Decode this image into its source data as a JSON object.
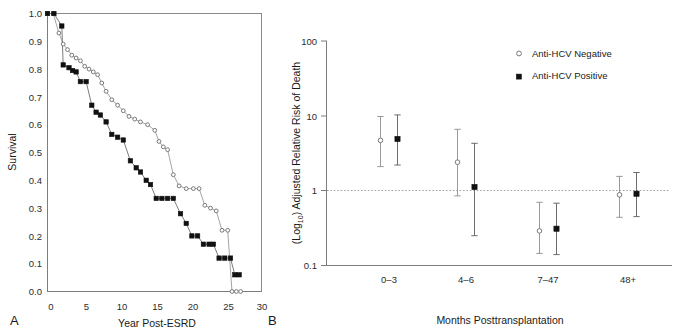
{
  "figure": {
    "panel_a_letter": "A",
    "panel_b_letter": "B"
  },
  "chart_data": [
    {
      "type": "line",
      "panel": "A",
      "title": "",
      "xlabel": "Year Post-ESRD",
      "ylabel": "Survival",
      "xlim": [
        0,
        30
      ],
      "ylim": [
        0.0,
        1.0
      ],
      "xticks": [
        "0",
        "5",
        "10",
        "15",
        "20",
        "25",
        "30"
      ],
      "yticks": [
        "0.0",
        "0.1",
        "0.2",
        "0.3",
        "0.4",
        "0.5",
        "0.6",
        "0.7",
        "0.8",
        "0.9",
        "1.0"
      ],
      "grid": false,
      "legend_position": "none",
      "series": [
        {
          "name": "Anti-HCV Negative",
          "marker": "open-circle",
          "x": [
            0.0,
            0.8,
            1.6,
            2.2,
            2.8,
            3.4,
            4.0,
            4.6,
            5.2,
            5.8,
            6.4,
            7.0,
            7.6,
            8.2,
            9.0,
            9.8,
            10.6,
            11.4,
            12.2,
            13.0,
            14.0,
            15.0,
            15.6,
            16.2,
            16.8,
            17.6,
            18.4,
            19.4,
            20.4,
            21.2,
            22.0,
            22.8,
            23.6,
            24.4,
            25.2,
            25.8,
            26.4,
            27.0
          ],
          "y": [
            1.0,
            1.0,
            0.93,
            0.89,
            0.87,
            0.85,
            0.84,
            0.83,
            0.81,
            0.8,
            0.79,
            0.78,
            0.75,
            0.72,
            0.69,
            0.67,
            0.65,
            0.63,
            0.62,
            0.61,
            0.6,
            0.58,
            0.54,
            0.52,
            0.51,
            0.42,
            0.38,
            0.37,
            0.37,
            0.37,
            0.31,
            0.3,
            0.29,
            0.22,
            0.22,
            0.0,
            0.0,
            0.0
          ]
        },
        {
          "name": "Anti-HCV Positive",
          "marker": "filled-square",
          "x": [
            0.0,
            0.9,
            2.0,
            2.2,
            3.0,
            3.5,
            4.0,
            4.6,
            5.4,
            6.2,
            6.8,
            7.4,
            8.2,
            9.0,
            9.8,
            10.6,
            11.6,
            12.4,
            13.0,
            13.8,
            14.4,
            15.2,
            16.0,
            16.8,
            17.6,
            18.6,
            19.4,
            20.2,
            21.0,
            21.8,
            22.6,
            23.2,
            24.0,
            24.8,
            25.6,
            26.2,
            26.8
          ],
          "y": [
            1.0,
            1.0,
            0.955,
            0.815,
            0.805,
            0.795,
            0.79,
            0.755,
            0.755,
            0.67,
            0.645,
            0.635,
            0.61,
            0.565,
            0.555,
            0.545,
            0.47,
            0.445,
            0.43,
            0.4,
            0.385,
            0.335,
            0.335,
            0.335,
            0.335,
            0.28,
            0.245,
            0.2,
            0.2,
            0.17,
            0.17,
            0.17,
            0.12,
            0.12,
            0.12,
            0.06,
            0.06
          ]
        }
      ]
    },
    {
      "type": "scatter",
      "panel": "B",
      "title": "",
      "xlabel": "Months Posttransplantation",
      "ylabel": "(Log10) Adjusted Relative Risk of Death",
      "ylabel_main": "(Log",
      "ylabel_sub": "10",
      "ylabel_rest": ") Adjusted Relative Risk of Death",
      "yscale": "log",
      "ylim": [
        0.1,
        100
      ],
      "yticks": [
        "100",
        "10",
        "1",
        "0.1"
      ],
      "categories": [
        "0–3",
        "4–6",
        "7–47",
        "48+"
      ],
      "reference_line": 1,
      "grid": false,
      "legend_position": "top-right",
      "series": [
        {
          "name": "Anti-HCV Negative",
          "marker": "open-circle",
          "values": [
            4.7,
            2.4,
            0.29,
            0.88
          ],
          "ci_low": [
            2.1,
            0.85,
            0.145,
            0.44
          ],
          "ci_high": [
            9.8,
            6.6,
            0.7,
            1.55
          ]
        },
        {
          "name": "Anti-HCV Positive",
          "marker": "filled-square",
          "values": [
            4.9,
            1.12,
            0.31,
            0.91
          ],
          "ci_low": [
            2.2,
            0.25,
            0.14,
            0.45
          ],
          "ci_high": [
            10.3,
            4.3,
            0.68,
            1.75
          ]
        }
      ]
    }
  ],
  "panel_a": {
    "ylabel": "Survival",
    "xlabel": "Year Post-ESRD",
    "yticks": [
      "1.0",
      "0.9",
      "0.8",
      "0.7",
      "0.6",
      "0.5",
      "0.4",
      "0.3",
      "0.2",
      "0.1",
      "0.0"
    ],
    "xticks": [
      "0",
      "5",
      "10",
      "15",
      "20",
      "25",
      "30"
    ]
  },
  "panel_b": {
    "ylabel_prefix": "(Log",
    "ylabel_sub": "10",
    "ylabel_suffix": ") Adjusted Relative Risk of Death",
    "xlabel": "Months Posttransplantation",
    "yticks": [
      "100",
      "10",
      "1",
      "0.1"
    ],
    "xticks": [
      "0–3",
      "4–6",
      "7–47",
      "48+"
    ],
    "legend": [
      {
        "label": "Anti-HCV Negative",
        "marker": "open-circle"
      },
      {
        "label": "Anti-HCV Positive",
        "marker": "filled-square"
      }
    ]
  },
  "colors": {
    "axis": "#7d7d7d",
    "open_marker_stroke": "#6b6b6b",
    "filled_marker": "#111111",
    "reference_line": "#9a9a9a",
    "text": "#1a1a1a"
  }
}
